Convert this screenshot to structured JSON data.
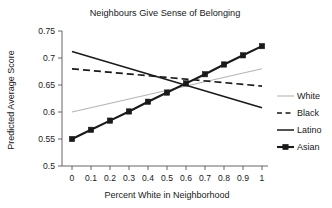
{
  "chart_data": {
    "type": "line",
    "title": "Neighbours Give Sense of Belonging",
    "xlabel": "Percent White in Neighborhood",
    "ylabel": "Predicted Average Score",
    "xlim": [
      0,
      1
    ],
    "ylim": [
      0.5,
      0.75
    ],
    "grid": false,
    "legend_position": "right",
    "xticks": [
      0,
      0.1,
      0.2,
      0.3,
      0.4,
      0.5,
      0.6,
      0.7,
      0.8,
      0.9,
      1
    ],
    "xtick_labels": [
      "0",
      "0.1",
      "0.2",
      "0.3",
      "0.4",
      "0.5",
      "0.6",
      "0.7",
      "0.8",
      "0.9",
      "1"
    ],
    "yticks": [
      0.5,
      0.55,
      0.6,
      0.65,
      0.7,
      0.75
    ],
    "ytick_labels": [
      "0.5",
      "0.55",
      "0.6",
      "0.65",
      "0.7",
      "0.75"
    ],
    "series": [
      {
        "name": "White",
        "style": "solid-light",
        "color": "#b4b4b4",
        "width": 1.1,
        "markers": false,
        "x": [
          0,
          1
        ],
        "values": [
          0.6,
          0.68
        ]
      },
      {
        "name": "Black",
        "style": "dashed",
        "color": "#1a1a1a",
        "width": 1.7,
        "markers": false,
        "x": [
          0,
          1
        ],
        "values": [
          0.68,
          0.648
        ]
      },
      {
        "name": "Latino",
        "style": "solid",
        "color": "#1a1a1a",
        "width": 1.5,
        "markers": false,
        "x": [
          0,
          1
        ],
        "values": [
          0.712,
          0.608
        ]
      },
      {
        "name": "Asian",
        "style": "solid-thick-marker",
        "color": "#1a1a1a",
        "width": 2.1,
        "markers": true,
        "x": [
          0,
          0.1,
          0.2,
          0.3,
          0.4,
          0.5,
          0.6,
          0.7,
          0.8,
          0.9,
          1
        ],
        "values": [
          0.55,
          0.567,
          0.584,
          0.601,
          0.619,
          0.636,
          0.653,
          0.67,
          0.688,
          0.705,
          0.722
        ]
      }
    ]
  },
  "legend": {
    "entries": [
      {
        "label": "White"
      },
      {
        "label": "Black"
      },
      {
        "label": "Latino"
      },
      {
        "label": "Asian"
      }
    ]
  }
}
